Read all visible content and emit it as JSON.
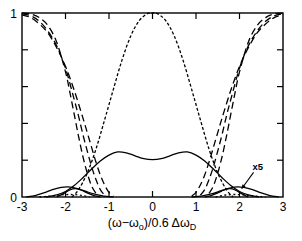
{
  "figure": {
    "background_color": "#ffffff",
    "line_color": "#000000",
    "plot_box": {
      "left": 22,
      "top": 13,
      "right": 283,
      "bottom": 197
    }
  },
  "axis": {
    "x_title_parts": {
      "open": "(ω−ω",
      "sub1": "o",
      "mid": ")/0.6 Δω",
      "sub2": "D"
    },
    "x_tick_labels": [
      "-3",
      "-2",
      "-1",
      "0",
      "1",
      "2",
      "3"
    ],
    "y_tick_labels": [
      "0",
      "1"
    ]
  },
  "annotations": [
    {
      "name": "x5-scale-note",
      "text": "x5",
      "x": 258,
      "y": 170
    }
  ],
  "chart_data": {
    "type": "line",
    "title": "",
    "xlabel": "(ω−ωo)/0.6 ΔωD",
    "ylabel": "",
    "xlim": [
      -3,
      3
    ],
    "ylim": [
      0,
      1
    ],
    "x_ticks": [
      -3,
      -2,
      -1,
      0,
      1,
      2,
      3
    ],
    "y_ticks": [
      0,
      0.2,
      0.4,
      0.6,
      0.8,
      1.0
    ],
    "y_labeled_ticks": [
      0,
      1
    ],
    "grid": false,
    "legend": "none",
    "annotations": [
      {
        "text": "x5",
        "x": 2.3,
        "y": 0.145,
        "arrow_to": [
          2.05,
          0.045
        ]
      }
    ],
    "series": [
      {
        "name": "dispersion-branch-outer-left",
        "style": "dashed",
        "dash": "7,4",
        "x": [
          -3.0,
          -2.8,
          -2.6,
          -2.4,
          -2.2,
          -2.0,
          -1.9,
          -1.8,
          -1.7,
          -1.6,
          -1.5,
          -1.4,
          -1.3
        ],
        "y": [
          1.0,
          0.995,
          0.975,
          0.93,
          0.84,
          0.68,
          0.57,
          0.45,
          0.33,
          0.22,
          0.13,
          0.06,
          0.02
        ]
      },
      {
        "name": "dispersion-branch-mid-left",
        "style": "dashed",
        "dash": "7,4",
        "x": [
          -3.0,
          -2.8,
          -2.6,
          -2.4,
          -2.2,
          -2.0,
          -1.8,
          -1.7,
          -1.6,
          -1.5,
          -1.4,
          -1.3,
          -1.2,
          -1.1
        ],
        "y": [
          0.995,
          0.985,
          0.955,
          0.9,
          0.82,
          0.7,
          0.53,
          0.44,
          0.34,
          0.25,
          0.165,
          0.095,
          0.04,
          0.01
        ]
      },
      {
        "name": "dispersion-branch-inner-left",
        "style": "dashed",
        "dash": "7,4",
        "x": [
          -3.0,
          -2.8,
          -2.6,
          -2.4,
          -2.2,
          -2.0,
          -1.8,
          -1.6,
          -1.5,
          -1.4,
          -1.3,
          -1.2,
          -1.1,
          -1.0,
          -0.9
        ],
        "y": [
          0.99,
          0.975,
          0.94,
          0.89,
          0.81,
          0.71,
          0.58,
          0.43,
          0.35,
          0.27,
          0.19,
          0.12,
          0.065,
          0.025,
          0.005
        ]
      },
      {
        "name": "central-peak-branch",
        "style": "dotted-dashed",
        "dash": "3,2",
        "x": [
          -1.85,
          -1.7,
          -1.5,
          -1.3,
          -1.1,
          -0.9,
          -0.7,
          -0.5,
          -0.3,
          -0.1,
          0.0,
          0.1,
          0.3,
          0.5,
          0.7,
          0.9,
          1.1,
          1.3,
          1.5,
          1.7,
          1.85
        ],
        "y": [
          0.0,
          0.04,
          0.13,
          0.26,
          0.42,
          0.585,
          0.745,
          0.875,
          0.96,
          0.998,
          1.0,
          0.998,
          0.96,
          0.875,
          0.745,
          0.585,
          0.42,
          0.26,
          0.13,
          0.04,
          0.0
        ]
      },
      {
        "name": "dispersion-branch-inner-right",
        "style": "dashed",
        "dash": "7,4",
        "x": [
          0.9,
          1.0,
          1.1,
          1.2,
          1.3,
          1.4,
          1.5,
          1.6,
          1.8,
          2.0,
          2.2,
          2.4,
          2.6,
          2.8,
          3.0
        ],
        "y": [
          0.005,
          0.025,
          0.065,
          0.12,
          0.19,
          0.27,
          0.35,
          0.43,
          0.58,
          0.71,
          0.81,
          0.89,
          0.94,
          0.975,
          0.99
        ]
      },
      {
        "name": "dispersion-branch-mid-right",
        "style": "dashed",
        "dash": "7,4",
        "x": [
          1.1,
          1.2,
          1.3,
          1.4,
          1.5,
          1.6,
          1.7,
          1.8,
          2.0,
          2.2,
          2.4,
          2.6,
          2.8,
          3.0
        ],
        "y": [
          0.01,
          0.04,
          0.095,
          0.165,
          0.25,
          0.34,
          0.44,
          0.53,
          0.7,
          0.82,
          0.9,
          0.955,
          0.985,
          0.995
        ]
      },
      {
        "name": "dispersion-branch-outer-right",
        "style": "dashed",
        "dash": "7,4",
        "x": [
          1.3,
          1.4,
          1.5,
          1.6,
          1.7,
          1.8,
          1.9,
          2.0,
          2.2,
          2.4,
          2.6,
          2.8,
          3.0
        ],
        "y": [
          0.02,
          0.06,
          0.13,
          0.22,
          0.33,
          0.45,
          0.57,
          0.68,
          0.84,
          0.93,
          0.975,
          0.995,
          1.0
        ]
      },
      {
        "name": "main-solid-double-hump",
        "style": "solid",
        "x": [
          -2.45,
          -2.2,
          -2.0,
          -1.8,
          -1.6,
          -1.4,
          -1.2,
          -1.0,
          -0.8,
          -0.6,
          -0.4,
          -0.2,
          0.0,
          0.2,
          0.4,
          0.6,
          0.8,
          1.0,
          1.2,
          1.4,
          1.6,
          1.8,
          2.0,
          2.2,
          2.45
        ],
        "y": [
          0.0,
          0.012,
          0.03,
          0.062,
          0.105,
          0.152,
          0.196,
          0.228,
          0.245,
          0.24,
          0.224,
          0.208,
          0.203,
          0.208,
          0.224,
          0.24,
          0.245,
          0.228,
          0.196,
          0.152,
          0.105,
          0.062,
          0.03,
          0.012,
          0.0
        ]
      },
      {
        "name": "satellite-solid-left",
        "style": "solid",
        "x": [
          -2.9,
          -2.7,
          -2.5,
          -2.3,
          -2.1,
          -1.95,
          -1.8,
          -1.65,
          -1.5,
          -1.35,
          -1.2,
          -1.05,
          -0.9
        ],
        "y": [
          0.0,
          0.008,
          0.022,
          0.04,
          0.052,
          0.055,
          0.05,
          0.04,
          0.028,
          0.017,
          0.009,
          0.003,
          0.0
        ]
      },
      {
        "name": "satellite-solid-right",
        "style": "solid",
        "x": [
          0.9,
          1.05,
          1.2,
          1.35,
          1.5,
          1.65,
          1.8,
          1.95,
          2.1,
          2.3,
          2.5,
          2.7,
          2.9
        ],
        "y": [
          0.0,
          0.003,
          0.009,
          0.017,
          0.028,
          0.04,
          0.05,
          0.055,
          0.052,
          0.04,
          0.022,
          0.008,
          0.0
        ]
      },
      {
        "name": "satellite-solid-left-narrow",
        "style": "solid",
        "x": [
          -2.2,
          -2.05,
          -1.9,
          -1.78,
          -1.65,
          -1.5,
          -1.35,
          -1.2
        ],
        "y": [
          0.0,
          0.018,
          0.038,
          0.045,
          0.038,
          0.022,
          0.008,
          0.0
        ]
      },
      {
        "name": "satellite-solid-right-narrow",
        "style": "solid",
        "x": [
          1.2,
          1.35,
          1.5,
          1.65,
          1.78,
          1.9,
          2.05,
          2.2
        ],
        "y": [
          0.0,
          0.008,
          0.022,
          0.038,
          0.045,
          0.038,
          0.018,
          0.0
        ]
      },
      {
        "name": "baseline-dotted-left",
        "style": "dotted",
        "dash": "2,2.5",
        "x": [
          -2.6,
          -2.4,
          -2.2,
          -2.0,
          -1.8,
          -1.6,
          -1.45
        ],
        "y": [
          0.0,
          0.004,
          0.009,
          0.013,
          0.013,
          0.008,
          0.0
        ]
      },
      {
        "name": "baseline-dotted-right",
        "style": "dotted",
        "dash": "2,2.5",
        "x": [
          1.45,
          1.6,
          1.8,
          2.0,
          2.2,
          2.4,
          2.6
        ],
        "y": [
          0.0,
          0.008,
          0.013,
          0.013,
          0.009,
          0.004,
          0.0
        ]
      }
    ]
  }
}
